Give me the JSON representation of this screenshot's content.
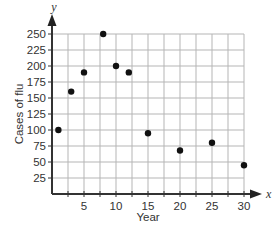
{
  "chart_data": {
    "type": "scatter",
    "title": "",
    "xlabel": "Year",
    "ylabel": "Cases of flu",
    "x_axis_variable": "x",
    "y_axis_variable": "y",
    "xlim": [
      0,
      30
    ],
    "ylim": [
      0,
      250
    ],
    "x_ticks": [
      5,
      10,
      15,
      20,
      25,
      30
    ],
    "x_tick_labels": [
      "5",
      "10",
      "15",
      "20",
      "25",
      "30"
    ],
    "x_grid_step": 2.5,
    "y_ticks": [
      25,
      50,
      75,
      100,
      125,
      150,
      175,
      200,
      225,
      250
    ],
    "y_tick_labels": [
      "25",
      "50",
      "75",
      "100",
      "125",
      "150",
      "175",
      "200",
      "225",
      "250"
    ],
    "y_grid_step": 25,
    "grid": true,
    "legend": null,
    "series": [
      {
        "name": "Cases of flu",
        "color": "#111111",
        "points": [
          {
            "x": 1,
            "y": 100
          },
          {
            "x": 3,
            "y": 160
          },
          {
            "x": 5,
            "y": 190
          },
          {
            "x": 8,
            "y": 250
          },
          {
            "x": 10,
            "y": 200
          },
          {
            "x": 12,
            "y": 190
          },
          {
            "x": 15,
            "y": 95
          },
          {
            "x": 20,
            "y": 68
          },
          {
            "x": 25,
            "y": 80
          },
          {
            "x": 30,
            "y": 45
          }
        ]
      }
    ]
  },
  "labels": {
    "xlabel": "Year",
    "ylabel": "Cases of flu",
    "x_var": "x",
    "y_var": "y"
  },
  "colors": {
    "grid": "#b5b5b5",
    "axis": "#333333",
    "point": "#111111"
  }
}
